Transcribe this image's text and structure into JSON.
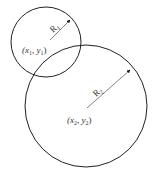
{
  "diagram": {
    "type": "two-circles",
    "circles": [
      {
        "id": "circle-1",
        "center": [
          46,
          42
        ],
        "radius": 35,
        "radius_label": "R",
        "radius_subscript": "1",
        "center_label": "(x",
        "center_x_sub": "1",
        "center_sep": ", y",
        "center_y_sub": "1",
        "center_close": ")",
        "radius_line": [
          50,
          40,
          70,
          20
        ]
      },
      {
        "id": "circle-2",
        "center": [
          86,
          106
        ],
        "radius": 61,
        "radius_label": "R",
        "radius_subscript": "2",
        "center_label": "(x",
        "center_x_sub": "2",
        "center_sep": ", y",
        "center_y_sub": "2",
        "center_close": ")",
        "radius_line": [
          87,
          108,
          130,
          70
        ]
      }
    ],
    "stroke_color": "#222222"
  }
}
